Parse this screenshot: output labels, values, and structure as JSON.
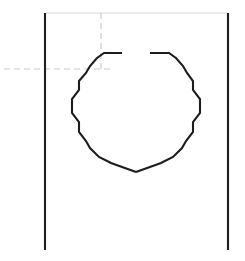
{
  "drawing": {
    "title": "",
    "background_color": "#ffffff",
    "width": 245,
    "height": 261,
    "colors": {
      "outline": "#1d1d1d",
      "light_outline": "#d8d8d8",
      "centerline": "#c9c9c9"
    },
    "plate": {
      "name": "plate-outline",
      "left_edge": {
        "x1": 45,
        "y1": 13,
        "x2": 45,
        "y2": 250
      },
      "right_edge": {
        "x1": 228,
        "y1": 13,
        "x2": 228,
        "y2": 250
      },
      "top_edge": {
        "x1": 45,
        "y1": 13,
        "x2": 228,
        "y2": 13
      }
    },
    "centerlines": {
      "horizontal": {
        "x1": 4,
        "y1": 69,
        "x2": 110,
        "y2": 69
      },
      "vertical": {
        "x1": 101,
        "y1": 13,
        "x2": 101,
        "y2": 72
      }
    },
    "profile": {
      "name": "polygonal-opening",
      "description": "Polygonal opening with break gap at top and V notch at bottom",
      "left_arc_points": "122,53 104,53 97,58 90,66 86,73 79,81 79,90 72,99 72,113 79,122 79,132 86,141 90,148 99,157 111,163",
      "right_arc_points": "150,53 169,53 176,58 183,66 187,73 193,81 193,90 200,99 200,113 193,122 193,132 186,141 182,148 173,157 161,163",
      "notch_apex": "136,172",
      "gap_top": {
        "x_start": 122,
        "x_end": 150,
        "y": 53
      }
    }
  }
}
